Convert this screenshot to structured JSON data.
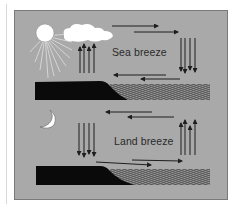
{
  "diagram": {
    "panels": [
      {
        "id": "day",
        "label": "Sea breeze",
        "icons": [
          "sun-icon",
          "cloud-icon"
        ],
        "flow": {
          "upper": "land-to-sea",
          "over_sea": "sinking",
          "surface": "sea-to-land",
          "over_land": "rising"
        }
      },
      {
        "id": "night",
        "label": "Land breeze",
        "icons": [
          "moon-icon"
        ],
        "flow": {
          "upper": "sea-to-land",
          "over_land": "sinking",
          "surface": "land-to-sea",
          "over_sea": "rising"
        }
      }
    ],
    "colors": {
      "background": "#a9a9a9",
      "land": "#0a0a0a",
      "sea_lines": "#1a1a1a",
      "arrows": "#1e1e1e",
      "sun": "#ffffff",
      "cloud": "#ffffff",
      "moon": "#ffffff",
      "border": "#7a7a7a"
    }
  }
}
